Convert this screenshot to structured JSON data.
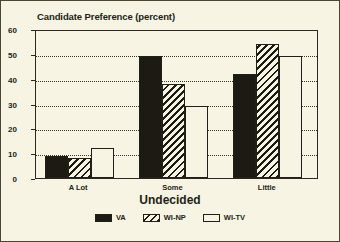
{
  "chart_data": {
    "type": "bar",
    "title": "Candidate Preference (percent)",
    "xlabel": "Undecided",
    "ylabel": "",
    "categories": [
      "A Lot",
      "Some",
      "Little"
    ],
    "series": [
      {
        "name": "VA",
        "values": [
          9,
          49,
          42
        ],
        "pattern": "solid"
      },
      {
        "name": "WI-NP",
        "values": [
          8,
          38,
          54
        ],
        "pattern": "diagonal-hatch"
      },
      {
        "name": "WI-TV",
        "values": [
          12,
          29,
          49
        ],
        "pattern": "dots"
      }
    ],
    "ylim": [
      0,
      60
    ],
    "yticks": [
      0,
      10,
      20,
      30,
      40,
      50,
      60
    ],
    "ytick_labels": [
      "0",
      "10",
      "20",
      "30",
      "40",
      "50",
      "60"
    ],
    "grid": true,
    "grid_axis": "y",
    "legend_position": "bottom",
    "colors": {
      "background": "#f7f4e4",
      "ink": "#221f16",
      "bar_fill": "#1c1a12",
      "gridline": "#3a362a"
    }
  }
}
